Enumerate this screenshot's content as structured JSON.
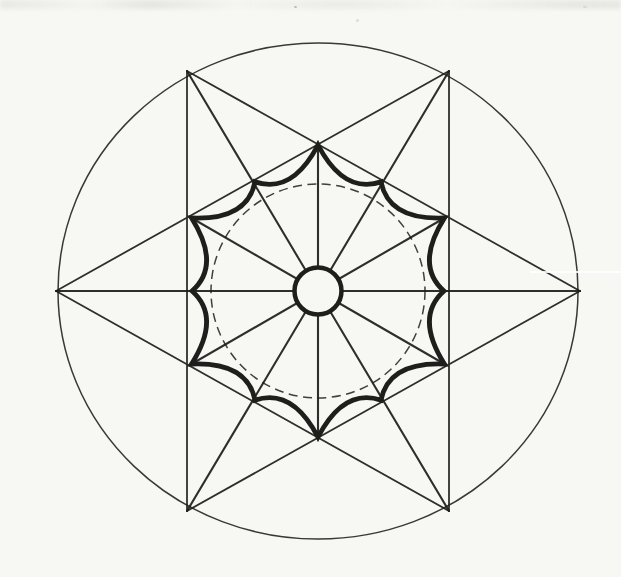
{
  "figure": {
    "canvas": {
      "width": 621,
      "height": 577
    },
    "paper_color": "#f7f7f3",
    "ink_color": "#1e1e1c",
    "center": {
      "x": 318,
      "y": 291
    },
    "outer_circle": {
      "rx": 260,
      "ry": 248,
      "stroke_width": 1.5
    },
    "hexagram": {
      "vertex_rx": 262,
      "vertex_ry": 254,
      "vertex_angles_deg": [
        0,
        60,
        120,
        180,
        240,
        300
      ],
      "chords": [
        [
          0,
          2
        ],
        [
          2,
          4
        ],
        [
          4,
          0
        ],
        [
          1,
          3
        ],
        [
          3,
          5
        ],
        [
          5,
          1
        ]
      ],
      "stroke_width": 1.8
    },
    "radials": {
      "angles_deg": [
        0,
        30,
        60,
        90,
        120,
        150,
        180,
        210,
        240,
        270,
        300,
        330
      ],
      "cusp_ray_radius": 146,
      "stroke_width": 2.1
    },
    "curved_star": {
      "cusp_count": 12,
      "step_deg": 30,
      "long_cusp_radius": 146,
      "short_cusp_radius": 126,
      "control_radius": 100,
      "stroke_width": 4.8
    },
    "dashed_circle": {
      "radius": 107,
      "stroke_width": 1.5,
      "dash_pattern": "9 5.5"
    },
    "center_circle": {
      "radius": 23.5,
      "stroke_width": 4.5
    }
  }
}
